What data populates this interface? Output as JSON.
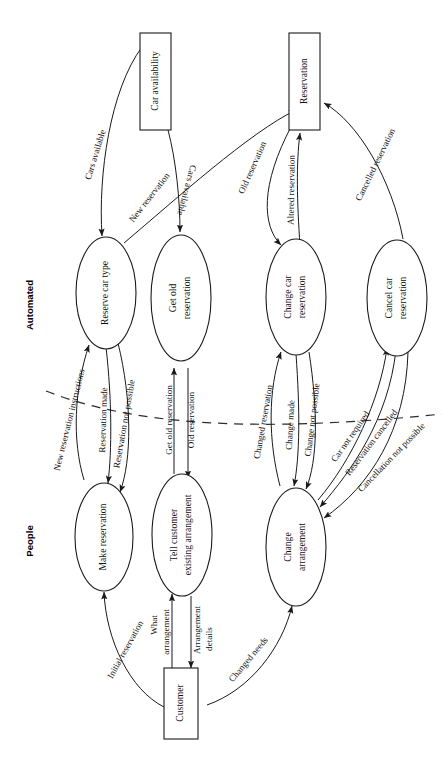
{
  "diagram": {
    "orientation": "rotated-90",
    "zones": [
      {
        "id": "automated",
        "label": "Automated"
      },
      {
        "id": "people",
        "label": "People"
      }
    ],
    "boundary": {
      "style": "dashed",
      "name": "automation-boundary"
    },
    "stores": [
      {
        "id": "car-availability",
        "label": "Car availability"
      },
      {
        "id": "reservation",
        "label": "Reservation"
      }
    ],
    "externals": [
      {
        "id": "customer",
        "label": "Customer"
      }
    ],
    "processes": [
      {
        "id": "reserve-car-type",
        "label": "Reserve car type",
        "zone": "automated"
      },
      {
        "id": "get-old-reservation",
        "label": "Get old reservation",
        "zone": "automated"
      },
      {
        "id": "change-car-reservation",
        "label": "Change car reservation",
        "zone": "automated"
      },
      {
        "id": "cancel-car-reservation",
        "label": "Cancel car reservation",
        "zone": "automated"
      },
      {
        "id": "make-reservation",
        "label": "Make reservation",
        "zone": "people"
      },
      {
        "id": "tell-customer-existing-arrangement",
        "label": "Tell customer existing arrangement",
        "zone": "people"
      },
      {
        "id": "change-arrangement",
        "label": "Change arrangement",
        "zone": "people"
      }
    ],
    "flows": [
      {
        "id": "f1",
        "label": "Cars available",
        "from": "car-availability",
        "to": "reserve-car-type"
      },
      {
        "id": "f2",
        "label": "New reservation",
        "from": "reserve-car-type",
        "to": "reservation"
      },
      {
        "id": "f3",
        "label": "Cars available",
        "from": "car-availability",
        "to": "get-old-reservation"
      },
      {
        "id": "f4",
        "label": "Old reservation",
        "from": "reservation",
        "to": "change-car-reservation"
      },
      {
        "id": "f5",
        "label": "Altered reservation",
        "from": "change-car-reservation",
        "to": "reservation"
      },
      {
        "id": "f6",
        "label": "Cancelled reservation",
        "from": "cancel-car-reservation",
        "to": "reservation"
      },
      {
        "id": "f7",
        "label": "New reservation instructions",
        "from": "make-reservation",
        "to": "reserve-car-type"
      },
      {
        "id": "f8",
        "label": "Reservation made",
        "from": "reserve-car-type",
        "to": "make-reservation"
      },
      {
        "id": "f9",
        "label": "Reservation not possible",
        "from": "reserve-car-type",
        "to": "make-reservation"
      },
      {
        "id": "f10",
        "label": "Get old reservation",
        "from": "tell-customer-existing-arrangement",
        "to": "get-old-reservation"
      },
      {
        "id": "f11",
        "label": "Old reservation",
        "from": "get-old-reservation",
        "to": "tell-customer-existing-arrangement"
      },
      {
        "id": "f12",
        "label": "Changed reservation",
        "from": "change-arrangement",
        "to": "change-car-reservation"
      },
      {
        "id": "f13",
        "label": "Change made",
        "from": "change-car-reservation",
        "to": "change-arrangement"
      },
      {
        "id": "f14",
        "label": "Change not possible",
        "from": "change-car-reservation",
        "to": "change-arrangement"
      },
      {
        "id": "f15",
        "label": "Car not required",
        "from": "change-arrangement",
        "to": "cancel-car-reservation"
      },
      {
        "id": "f16",
        "label": "Reservation cancelled",
        "from": "cancel-car-reservation",
        "to": "change-arrangement"
      },
      {
        "id": "f17",
        "label": "Cancellation not possible",
        "from": "cancel-car-reservation",
        "to": "change-arrangement"
      },
      {
        "id": "f18",
        "label": "Initial reservation",
        "from": "customer",
        "to": "make-reservation"
      },
      {
        "id": "f19",
        "label": "What arrangement",
        "from": "customer",
        "to": "tell-customer-existing-arrangement"
      },
      {
        "id": "f20",
        "label": "Arrangement details",
        "from": "tell-customer-existing-arrangement",
        "to": "customer"
      },
      {
        "id": "f21",
        "label": "Changed needs",
        "from": "customer",
        "to": "change-arrangement"
      }
    ],
    "colors": {
      "stroke": "#1a1a1a",
      "fill": "#ffffff",
      "text": "#101010"
    }
  }
}
